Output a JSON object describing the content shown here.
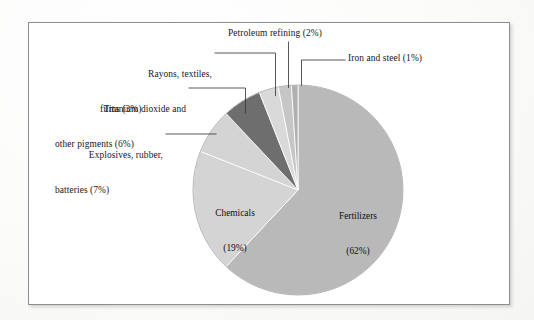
{
  "figure": {
    "frame_color": "#8e8e8e",
    "background": "#ffffff"
  },
  "chart_data": {
    "type": "pie",
    "title": "",
    "subtitle": "",
    "xlabel": "",
    "ylabel": "",
    "legend_position": "none",
    "grid": false,
    "units": "percent",
    "start_angle_deg": 0,
    "direction": "clockwise",
    "categories": [
      "Fertilizers",
      "Chemicals",
      "Explosives, rubber, batteries",
      "Titanium dioxide and other pigments",
      "Rayons, textiles, films",
      "Petroleum refining",
      "Iron and steel"
    ],
    "values": [
      62,
      19,
      7,
      6,
      3,
      2,
      1
    ],
    "slices": [
      {
        "name": "Fertilizers",
        "value": 62,
        "label_line1": "Fertilizers",
        "label_line2": "(62%)",
        "color": "#b9b9b9",
        "label_placement": "inside"
      },
      {
        "name": "Chemicals",
        "value": 19,
        "label_line1": "Chemicals",
        "label_line2": "(19%)",
        "color": "#d4d4d4",
        "label_placement": "inside"
      },
      {
        "name": "Explosives, rubber, batteries",
        "value": 7,
        "label_line1": "Explosives, rubber,",
        "label_line2": "batteries (7%)",
        "color": "#d4d4d4",
        "label_placement": "outside"
      },
      {
        "name": "Titanium dioxide and other pigments",
        "value": 6,
        "label_line1": "Titanium dioxide and",
        "label_line2": "other pigments (6%)",
        "color": "#6e6e6e",
        "label_placement": "outside"
      },
      {
        "name": "Rayons, textiles, films",
        "value": 3,
        "label_line1": "Rayons, textiles,",
        "label_line2": "films (3%)",
        "color": "#d9d9d9",
        "label_placement": "outside"
      },
      {
        "name": "Petroleum refining",
        "value": 2,
        "label_line1": "Petroleum refining (2%)",
        "label_line2": "",
        "color": "#c6c6c6",
        "label_placement": "outside"
      },
      {
        "name": "Iron and steel",
        "value": 1,
        "label_line1": "Iron and steel (1%)",
        "label_line2": "",
        "color": "#b0b0b0",
        "label_placement": "outside"
      }
    ]
  },
  "labels": {
    "petroleum_refining": "Petroleum refining (2%)",
    "iron_and_steel": "Iron and steel (1%)",
    "rayons_line1": "Rayons, textiles,",
    "rayons_line2": "films (3%)",
    "titanium_line1": "Titanium dioxide and",
    "titanium_line2": "other pigments (6%)",
    "explosives_line1": "Explosives, rubber,",
    "explosives_line2": "batteries (7%)",
    "chemicals_line1": "Chemicals",
    "chemicals_line2": "(19%)",
    "fertilizers_line1": "Fertilizers",
    "fertilizers_line2": "(62%)"
  }
}
